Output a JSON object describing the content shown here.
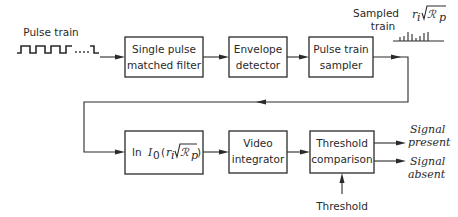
{
  "input": {
    "label": "Pulse train",
    "waveform": "pulse-train-waveform"
  },
  "blocks": {
    "matched_filter": {
      "line1": "Single pulse",
      "line2": "matched filter"
    },
    "envelope_detector": {
      "line1": "Envelope",
      "line2": "detector"
    },
    "sampler": {
      "line1": "Pulse train",
      "line2": "sampler"
    },
    "log_bessel": {
      "prefix": "ln",
      "func": "I",
      "func_sub": "0",
      "open": "(",
      "r": "r",
      "r_sub": "i",
      "R": "ℛ",
      "R_sub": "p",
      "close": ")"
    },
    "video_integrator": {
      "line1": "Video",
      "line2": "integrator"
    },
    "threshold_comparison": {
      "line1": "Threshold",
      "line2": "comparison"
    }
  },
  "sampled_train": {
    "label_line1": "Sampled",
    "label_line2": "train",
    "annotation": {
      "r": "r",
      "r_sub": "i",
      "R": "ℛ",
      "R_sub": "p"
    }
  },
  "threshold_input": {
    "label": "Threshold"
  },
  "outputs": {
    "present": {
      "line1": "Signal",
      "line2": "present"
    },
    "absent": {
      "line1": "Signal",
      "line2": "absent"
    }
  }
}
